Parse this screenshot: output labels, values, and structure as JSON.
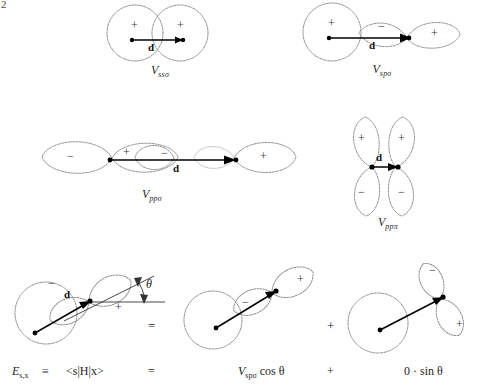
{
  "page": {
    "number": "2"
  },
  "figure": {
    "title_present": false,
    "panels": [
      {
        "id": "ss-sigma",
        "label": "V",
        "label_sub": "ssσ",
        "interaction": "s-s sigma",
        "vector_label": "d",
        "lobes": [
          {
            "orbital": "s",
            "sign": "+"
          },
          {
            "orbital": "s",
            "sign": "+"
          }
        ]
      },
      {
        "id": "sp-sigma",
        "label": "V",
        "label_sub": "spσ",
        "interaction": "s-p sigma",
        "vector_label": "d",
        "lobes": [
          {
            "orbital": "s",
            "sign": "+"
          },
          {
            "orbital": "p",
            "sign": "−"
          },
          {
            "orbital": "p",
            "sign": "+"
          }
        ]
      },
      {
        "id": "pp-sigma",
        "label": "V",
        "label_sub": "ppσ",
        "interaction": "p-p sigma",
        "vector_label": "d",
        "lobes": [
          {
            "orbital": "p",
            "sign": "−"
          },
          {
            "orbital": "p",
            "sign": "+"
          },
          {
            "orbital": "p",
            "sign": "−"
          },
          {
            "orbital": "p",
            "sign": "+"
          }
        ]
      },
      {
        "id": "pp-pi",
        "label": "V",
        "label_sub": "ppπ",
        "interaction": "p-p pi",
        "vector_label": "d",
        "lobes": [
          {
            "orbital": "p",
            "sign": "+"
          },
          {
            "orbital": "p",
            "sign": "+"
          },
          {
            "orbital": "p",
            "sign": "−"
          },
          {
            "orbital": "p",
            "sign": "−"
          }
        ]
      }
    ],
    "decomposition": {
      "angle_symbol": "θ",
      "vector_label": "d",
      "operator_equals": "=",
      "operator_plus": "+",
      "left_panel": {
        "id": "tilted-sp",
        "lobes": [
          {
            "orbital": "s",
            "sign": ""
          },
          {
            "orbital": "p",
            "sign": "−"
          },
          {
            "orbital": "p",
            "sign": "+"
          }
        ]
      },
      "middle_panel": {
        "id": "sigma-component",
        "lobes": [
          {
            "orbital": "p",
            "sign": "−"
          },
          {
            "orbital": "p",
            "sign": "+"
          }
        ]
      },
      "right_panel": {
        "id": "pi-component",
        "lobes": [
          {
            "orbital": "p",
            "sign": "−"
          },
          {
            "orbital": "p",
            "sign": "+"
          }
        ]
      }
    },
    "equation": {
      "lhs_symbol": "E",
      "lhs_sub": "s,x",
      "identity": "≡",
      "bracket": "<s|H|x>",
      "equals": "=",
      "term1_symbol": "V",
      "term1_sub": "spσ",
      "term1_factor": "cos θ",
      "plus": "+",
      "term2_coefficient": "0",
      "term2_dot": "·",
      "term2_factor": "sin θ"
    }
  }
}
